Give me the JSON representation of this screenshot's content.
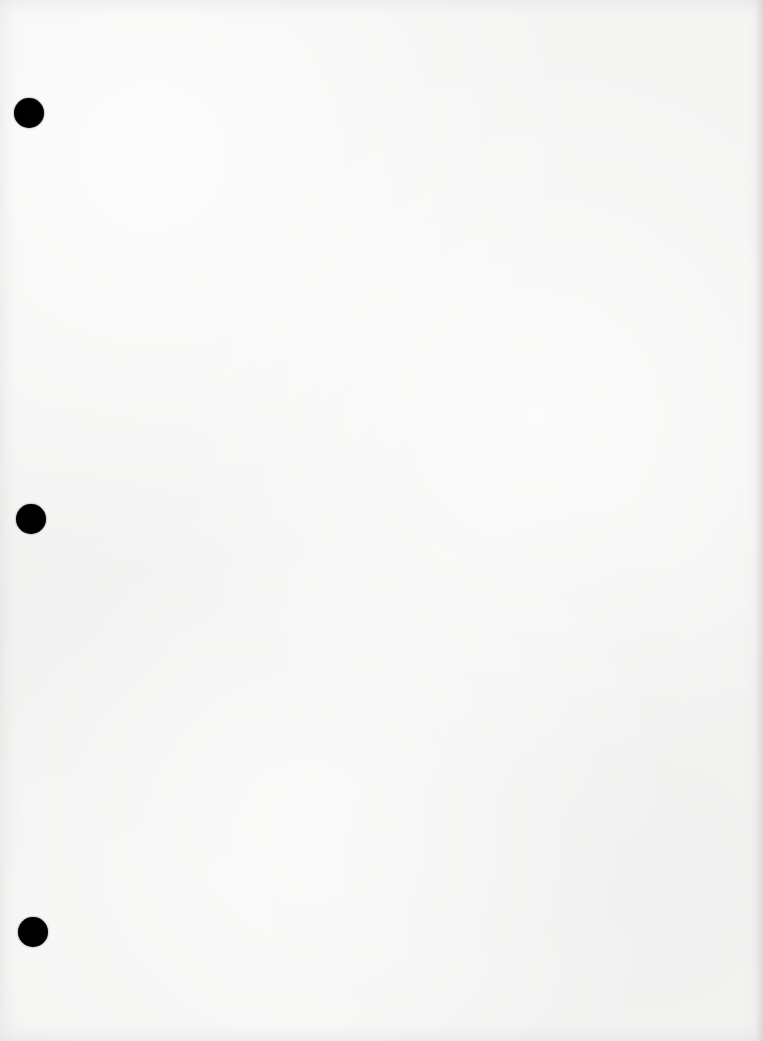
{
  "document": {
    "type": "blank scanned page",
    "background_color": "#f5f5f4",
    "punch_holes": [
      {
        "cx": 29,
        "cy": 113,
        "r": 15,
        "color": "#000000"
      },
      {
        "cx": 31,
        "cy": 519,
        "r": 15,
        "color": "#000000"
      },
      {
        "cx": 33,
        "cy": 932,
        "r": 15,
        "color": "#000000"
      }
    ]
  }
}
